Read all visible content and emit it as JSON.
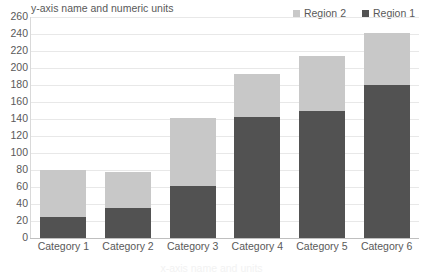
{
  "chart_data": {
    "type": "bar",
    "subtype": "stacked-bar",
    "title": "",
    "axis_title": "y-axis name and numeric units",
    "xlabel": "x-axis name and units",
    "ylabel": "y-axis name and numeric units",
    "categories": [
      "Category 1",
      "Category 2",
      "Category 3",
      "Category 4",
      "Category 5",
      "Category 6"
    ],
    "series": [
      {
        "name": "Region 1",
        "color": "#525252",
        "values": [
          25,
          35,
          61,
          142,
          150,
          180
        ]
      },
      {
        "name": "Region 2",
        "color": "#c8c8c8",
        "values": [
          55,
          43,
          80,
          51,
          64,
          61
        ]
      }
    ],
    "totals": [
      80,
      78,
      141,
      193,
      214,
      241
    ],
    "ylim": [
      0,
      260
    ],
    "ytick_step": 20,
    "yticks": [
      260,
      240,
      220,
      200,
      180,
      160,
      140,
      120,
      100,
      80,
      60,
      40,
      20,
      0
    ],
    "grid": true,
    "legend_position": "top-right",
    "legend_order": [
      "Region 2",
      "Region 1"
    ]
  },
  "legend": {
    "items": [
      {
        "label": "Region 2",
        "color": "#c8c8c8"
      },
      {
        "label": "Region 1",
        "color": "#525252"
      }
    ]
  },
  "colors": {
    "series_light": "#c8c8c8",
    "series_dark": "#525252",
    "gridline": "#e8e8e8",
    "axis": "#bfbfbf",
    "text": "#595959",
    "background": "#ffffff"
  }
}
